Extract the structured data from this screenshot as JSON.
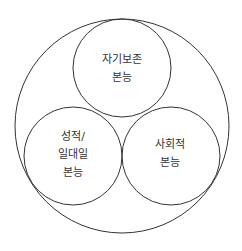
{
  "diagram": {
    "type": "nested-circles",
    "outer_circle": {
      "label": ""
    },
    "circles": [
      {
        "id": "self-preservation",
        "lines": [
          "자기보존",
          "본능"
        ]
      },
      {
        "id": "sexual",
        "lines": [
          "성적/",
          "일대일",
          "본능"
        ]
      },
      {
        "id": "social",
        "lines": [
          "사회적",
          "본능"
        ]
      }
    ],
    "colors": {
      "stroke": "#333333",
      "text": "#333333",
      "background": "#ffffff"
    }
  }
}
